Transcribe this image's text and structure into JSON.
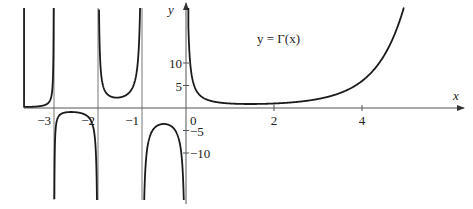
{
  "chart_data": {
    "type": "line",
    "title": "",
    "function_label": "y = Γ(x)",
    "xlabel": "x",
    "ylabel": "y",
    "xlim": [
      -3.75,
      6.3
    ],
    "ylim": [
      -20.5,
      22.5
    ],
    "x_ticks": [
      {
        "value": -3,
        "label": "−3"
      },
      {
        "value": -2,
        "label": "−2"
      },
      {
        "value": -1,
        "label": "−1"
      },
      {
        "value": 0,
        "label": "0"
      },
      {
        "value": 2,
        "label": "2"
      },
      {
        "value": 4,
        "label": "4"
      }
    ],
    "y_ticks": [
      {
        "value": 10,
        "label": "10"
      },
      {
        "value": 5,
        "label": "5"
      },
      {
        "value": -5,
        "label": "−5"
      },
      {
        "value": -10,
        "label": "−10"
      }
    ],
    "vertical_asymptotes": [
      -3,
      -2,
      -1,
      0
    ],
    "grid": false,
    "legend": "none",
    "series": [
      {
        "name": "Γ(x), x in (-3.6,-3)",
        "x": [
          -3.6,
          -3.4,
          -3.2,
          -3.1,
          -3.05
        ],
        "y": [
          0.31,
          0.53,
          1.08,
          2.21,
          4.3
        ]
      },
      {
        "name": "Γ(x), x in (-3,-2)",
        "x": [
          -2.95,
          -2.8,
          -2.5,
          -2.2,
          -2.05
        ],
        "y": [
          -7.3,
          -1.85,
          -0.95,
          -1.75,
          -6.0
        ]
      },
      {
        "name": "Γ(x), x in (-2,-1)",
        "x": [
          -1.95,
          -1.8,
          -1.5,
          -1.2,
          -1.05
        ],
        "y": [
          10.3,
          3.6,
          2.36,
          3.3,
          9.9
        ]
      },
      {
        "name": "Γ(x), x in (-1,0)",
        "x": [
          -0.95,
          -0.8,
          -0.5,
          -0.2,
          -0.05
        ],
        "y": [
          -19.5,
          -5.74,
          -3.54,
          -5.82,
          -20.6
        ]
      },
      {
        "name": "Γ(x), x > 0",
        "x": [
          0.05,
          0.2,
          0.5,
          1,
          1.46,
          2,
          3,
          4,
          4.5,
          5,
          5.5
        ],
        "y": [
          19.47,
          4.59,
          1.77,
          1.0,
          0.886,
          1.0,
          2.0,
          6.0,
          11.63,
          24.0,
          52.34
        ]
      }
    ]
  },
  "layout": {
    "origin_px": [
      186,
      108
    ],
    "px_per_x_unit": 44,
    "px_per_y_unit": 4.5,
    "curve_color": "#1a1a1a",
    "axis_color": "#555555"
  }
}
